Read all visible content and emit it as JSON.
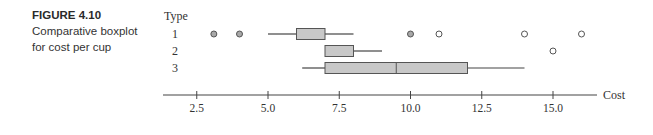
{
  "caption": {
    "figure_number": "FIGURE 4.10",
    "text": "Comparative boxplot for cost per cup"
  },
  "chart_data": {
    "type": "boxplot",
    "orientation": "horizontal",
    "title": "",
    "group_label": "Type",
    "xlabel": "Cost",
    "ylabel": "Type",
    "xlim": [
      1.3,
      16.5
    ],
    "xticks": [
      2.5,
      5.0,
      7.5,
      10.0,
      12.5,
      15.0
    ],
    "xtick_labels": [
      "2.5",
      "5.0",
      "7.5",
      "10.0",
      "12.5",
      "15.0"
    ],
    "grid": false,
    "legend": null,
    "categories": [
      "1",
      "2",
      "3"
    ],
    "series": [
      {
        "name": "1",
        "whisker_low": 5.0,
        "q1": 6.0,
        "median": 7.0,
        "q3": 7.0,
        "whisker_high": 8.0,
        "outliers": [
          {
            "value": 3.1,
            "style": "filled"
          },
          {
            "value": 4.0,
            "style": "filled"
          },
          {
            "value": 10.0,
            "style": "filled"
          },
          {
            "value": 11.0,
            "style": "open"
          },
          {
            "value": 14.0,
            "style": "open"
          },
          {
            "value": 16.0,
            "style": "open"
          }
        ]
      },
      {
        "name": "2",
        "whisker_low": 7.0,
        "q1": 7.0,
        "median": 7.0,
        "q3": 8.0,
        "whisker_high": 9.0,
        "outliers": [
          {
            "value": 15.0,
            "style": "open"
          }
        ]
      },
      {
        "name": "3",
        "whisker_low": 6.2,
        "q1": 7.0,
        "median": 9.5,
        "q3": 12.0,
        "whisker_high": 14.0,
        "outliers": []
      }
    ]
  },
  "colors": {
    "box_fill": "#c8c8c8",
    "box_stroke": "#555555",
    "line": "#444444",
    "outlier_filled": "#a8a8a8",
    "text": "#333333"
  },
  "layout": {
    "x0_px": 125.5,
    "px_per_unit": 28.5,
    "axis_y": 95,
    "axis_x_start": 163,
    "axis_x_end": 597,
    "row_y": [
      34,
      51,
      68
    ],
    "box_half_height": 5.5
  }
}
